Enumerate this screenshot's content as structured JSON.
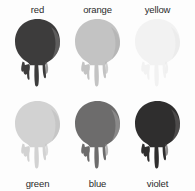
{
  "figure": {
    "background_color": "#fdfdfd",
    "label_color": "#2b2b2b",
    "columns": 3,
    "rows": 2,
    "swatch_shape": "paint-drip-blob",
    "drips_per_swatch": 3
  },
  "swatches": [
    {
      "name": "red",
      "label": "red",
      "row": "top",
      "label_position": "above",
      "fill": "#3d3c3c",
      "shadow": "#2a2929",
      "highlight": "#6a6868"
    },
    {
      "name": "orange",
      "label": "orange",
      "row": "top",
      "label_position": "above",
      "fill": "#c3c3c3",
      "shadow": "#b0b0b0",
      "highlight": "#dedede"
    },
    {
      "name": "yellow",
      "label": "yellow",
      "row": "top",
      "label_position": "above",
      "fill": "#f2f2f2",
      "shadow": "#e7e7e7",
      "highlight": "#fafafa"
    },
    {
      "name": "green",
      "label": "green",
      "row": "bottom",
      "label_position": "below",
      "fill": "#d2d2d2",
      "shadow": "#c0c0c0",
      "highlight": "#e8e8e8"
    },
    {
      "name": "blue",
      "label": "blue",
      "row": "bottom",
      "label_position": "below",
      "fill": "#6d6c6c",
      "shadow": "#565555",
      "highlight": "#969494"
    },
    {
      "name": "violet",
      "label": "violet",
      "row": "bottom",
      "label_position": "below",
      "fill": "#2f2e2e",
      "shadow": "#1e1d1d",
      "highlight": "#5a5858"
    }
  ]
}
